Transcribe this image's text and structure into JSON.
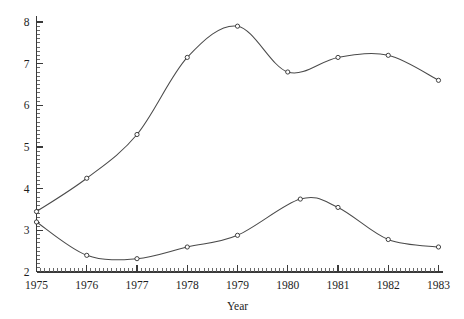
{
  "chart_data": {
    "type": "line",
    "title": "",
    "subtitle": "",
    "xlabel": "Year",
    "ylabel": "",
    "xlim": [
      1975,
      1983
    ],
    "ylim": [
      2,
      8
    ],
    "grid": false,
    "legend_position": "none",
    "x_ticks": [
      1975,
      1976,
      1977,
      1978,
      1979,
      1980,
      1981,
      1982,
      1983
    ],
    "x_tick_labels": [
      "1975",
      "1976",
      "1977",
      "1978",
      "1979",
      "1980",
      "1981",
      "1982",
      "1983"
    ],
    "y_ticks": [
      2,
      3,
      4,
      5,
      6,
      7,
      8
    ],
    "y_tick_labels": [
      "2",
      "3",
      "4",
      "5",
      "6",
      "7",
      "8"
    ],
    "x_minor_per_interval": 12,
    "y_minor_per_interval": 10,
    "marker": "open-circle",
    "series": [
      {
        "name": "upper-series",
        "x": [
          1975,
          1976,
          1977,
          1978,
          1979,
          1980,
          1981,
          1982,
          1983
        ],
        "values": [
          3.45,
          4.25,
          5.3,
          7.15,
          7.9,
          6.8,
          7.15,
          7.2,
          6.6
        ]
      },
      {
        "name": "lower-series",
        "x": [
          1975,
          1976,
          1977,
          1978,
          1979,
          1980.25,
          1981,
          1982,
          1983
        ],
        "values": [
          3.2,
          2.4,
          2.32,
          2.6,
          2.88,
          3.75,
          3.55,
          2.78,
          2.6
        ]
      }
    ]
  },
  "axes": {
    "x_title": "Year"
  }
}
